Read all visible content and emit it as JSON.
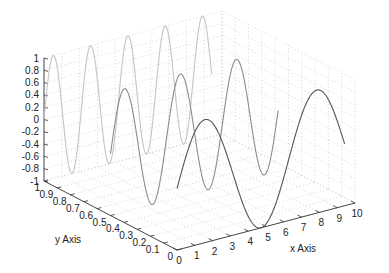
{
  "chart_data": {
    "type": "line",
    "projection": "3d",
    "view": {
      "azimuth": -37.5,
      "elevation": 30
    },
    "title": "",
    "xlabel": "x Axis",
    "ylabel": "y Axis",
    "zlabel": "",
    "xlim": [
      0,
      10
    ],
    "ylim": [
      0,
      1
    ],
    "zlim": [
      -1,
      1
    ],
    "x_ticks": [
      "0",
      "1",
      "2",
      "3",
      "4",
      "5",
      "6",
      "7",
      "8",
      "9",
      "10"
    ],
    "y_ticks": [
      "0",
      "0.1",
      "0.2",
      "0.3",
      "0.4",
      "0.5",
      "0.6",
      "0.7",
      "0.8",
      "0.9",
      "1"
    ],
    "z_ticks": [
      "-1",
      "-0.8",
      "-0.6",
      "-0.4",
      "-0.2",
      "0",
      "0.2",
      "0.4",
      "0.6",
      "0.8",
      "1"
    ],
    "grid": "dotted",
    "series": [
      {
        "name": "z = sin(x)",
        "y": 0,
        "frequency": 1,
        "x_range": [
          0,
          9.42
        ],
        "color": "#555555"
      },
      {
        "name": "z = sin(2x)",
        "y": 0.5,
        "frequency": 2,
        "x_range": [
          0,
          9.42
        ],
        "color": "#8c8c8c"
      },
      {
        "name": "z = sin(3x)",
        "y": 1,
        "frequency": 3,
        "x_range": [
          0,
          9.42
        ],
        "color": "#c4c4c4"
      }
    ]
  },
  "axes": {
    "x_label": "x Axis",
    "y_label": "y Axis"
  }
}
